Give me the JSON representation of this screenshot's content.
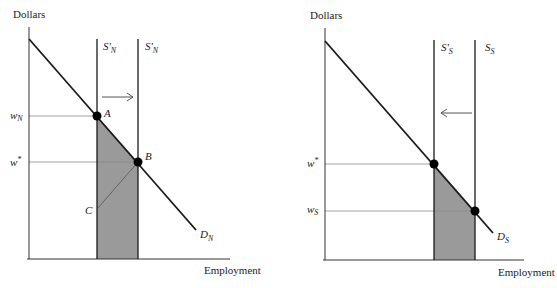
{
  "colors": {
    "background": "#ffffff",
    "line": "#1a1a1a",
    "thin_line": "#555555",
    "guide": "#8a8a8a",
    "shade": "#9a9a9a",
    "point": "#000000"
  },
  "panels": [
    {
      "id": "north",
      "y_axis_label": "Dollars",
      "x_axis_label": "Employment",
      "supply_curves": [
        {
          "label": "S'",
          "sub": "N"
        },
        {
          "label": "S'",
          "sub": "N"
        }
      ],
      "demand_label": {
        "label": "D",
        "sub": "N"
      },
      "wage_labels": [
        {
          "label": "w",
          "sub": "N"
        },
        {
          "label": "w",
          "sup": "*"
        }
      ],
      "points": [
        "A",
        "B",
        "C"
      ],
      "shift_arrow": "right"
    },
    {
      "id": "south",
      "y_axis_label": "Dollars",
      "x_axis_label": "Employment",
      "supply_curves": [
        {
          "label": "S'",
          "sub": "S"
        },
        {
          "label": "S",
          "sub": "S"
        }
      ],
      "demand_label": {
        "label": "D",
        "sub": "S"
      },
      "wage_labels": [
        {
          "label": "w",
          "sup": "*"
        },
        {
          "label": "w",
          "sub": "S"
        }
      ],
      "shift_arrow": "left"
    }
  ]
}
